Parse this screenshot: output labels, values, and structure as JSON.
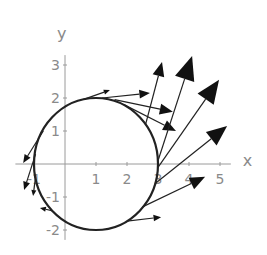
{
  "chart_data": {
    "type": "line",
    "title": "",
    "xlabel": "x",
    "ylabel": "y",
    "xlim": [
      -1.4,
      5.2
    ],
    "ylim": [
      -2.2,
      3.3
    ],
    "grid": false,
    "legend": "none",
    "x_ticks": [
      {
        "value": -1,
        "label": "-1"
      },
      {
        "value": 1,
        "label": "1"
      },
      {
        "value": 2,
        "label": "2"
      },
      {
        "value": 3,
        "label": "3"
      },
      {
        "value": 4,
        "label": "4"
      },
      {
        "value": 5,
        "label": "5"
      }
    ],
    "y_ticks": [
      {
        "value": 3,
        "label": "3"
      },
      {
        "value": 2,
        "label": "2"
      },
      {
        "value": 1,
        "label": "1"
      },
      {
        "value": -1,
        "label": "-1"
      },
      {
        "value": -2,
        "label": "-2"
      }
    ],
    "curve": {
      "name": "circle",
      "center": [
        1,
        0
      ],
      "radius": 2
    },
    "arrows": [
      {
        "from": [
          0.6,
          1.96
        ],
        "to": [
          1.45,
          2.24
        ]
      },
      {
        "from": [
          1.2,
          2.0
        ],
        "to": [
          2.74,
          2.15
        ]
      },
      {
        "from": [
          1.6,
          1.95
        ],
        "to": [
          3.48,
          1.58
        ]
      },
      {
        "from": [
          1.9,
          1.8
        ],
        "to": [
          3.58,
          1.0
        ]
      },
      {
        "from": [
          2.6,
          1.2
        ],
        "to": [
          3.13,
          3.09
        ]
      },
      {
        "from": [
          3.0,
          0.1
        ],
        "to": [
          4.1,
          3.27
        ]
      },
      {
        "from": [
          3.0,
          -0.1
        ],
        "to": [
          4.97,
          2.55
        ]
      },
      {
        "from": [
          2.9,
          -0.6
        ],
        "to": [
          5.23,
          1.15
        ]
      },
      {
        "from": [
          2.5,
          -1.3
        ],
        "to": [
          4.52,
          -0.39
        ]
      },
      {
        "from": [
          2.0,
          -1.73
        ],
        "to": [
          3.1,
          -1.61
        ]
      },
      {
        "from": [
          -0.7,
          1.0
        ],
        "to": [
          -1.35,
          0.03
        ]
      },
      {
        "from": [
          -0.95,
          0.3
        ],
        "to": [
          -1.32,
          -0.79
        ]
      },
      {
        "from": [
          -0.95,
          -0.4
        ],
        "to": [
          -1.03,
          -0.97
        ]
      },
      {
        "from": [
          -0.4,
          -1.42
        ],
        "to": [
          -0.81,
          -1.33
        ]
      }
    ]
  }
}
